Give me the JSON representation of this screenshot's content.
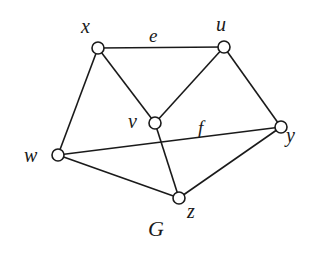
{
  "graph": {
    "name": "G",
    "name_position": {
      "x": 148,
      "y": 236
    },
    "node_radius": 6,
    "nodes": [
      {
        "id": "x",
        "label": "x",
        "cx": 98,
        "cy": 48,
        "lx": 81,
        "ly": 33
      },
      {
        "id": "u",
        "label": "u",
        "cx": 224,
        "cy": 47,
        "lx": 216,
        "ly": 31
      },
      {
        "id": "v",
        "label": "v",
        "cx": 155,
        "cy": 123,
        "lx": 128,
        "ly": 128
      },
      {
        "id": "y",
        "label": "y",
        "cx": 281,
        "cy": 127,
        "lx": 286,
        "ly": 142
      },
      {
        "id": "w",
        "label": "w",
        "cx": 58,
        "cy": 155,
        "lx": 24,
        "ly": 162
      },
      {
        "id": "z",
        "label": "z",
        "cx": 179,
        "cy": 198,
        "lx": 187,
        "ly": 218
      }
    ],
    "edges": [
      {
        "id": "e",
        "from": "x",
        "to": "u",
        "label": "e",
        "lx": 149,
        "ly": 42
      },
      {
        "from": "x",
        "to": "v"
      },
      {
        "from": "x",
        "to": "w"
      },
      {
        "from": "u",
        "to": "v"
      },
      {
        "from": "u",
        "to": "y"
      },
      {
        "from": "v",
        "to": "z"
      },
      {
        "id": "f",
        "from": "w",
        "to": "y",
        "label": "f",
        "lx": 198,
        "ly": 134
      },
      {
        "from": "w",
        "to": "z"
      },
      {
        "from": "z",
        "to": "y"
      }
    ]
  }
}
